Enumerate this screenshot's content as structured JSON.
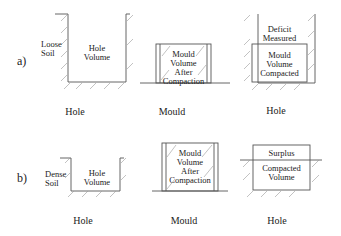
{
  "rows": [
    {
      "label": "a)",
      "soil_label_line1": "Loose",
      "soil_label_line2": "Soil",
      "hole_label_line1": "Hole",
      "hole_label_line2": "Volume",
      "mould_lines": [
        "Mould",
        "Volume",
        "After",
        "Compaction"
      ],
      "top_lines": [
        "Deficit",
        "Measured"
      ],
      "bottom_lines": [
        "Mould",
        "Volume",
        "Compacted"
      ],
      "captions": [
        "Hole",
        "Mould",
        "Hole"
      ]
    },
    {
      "label": "b)",
      "soil_label_line1": "Dense",
      "soil_label_line2": "Soil",
      "hole_label_line1": "Hole",
      "hole_label_line2": "Volume",
      "mould_lines": [
        "Mould",
        "Volume",
        "After",
        "Compaction"
      ],
      "top_lines": [
        "Surplus"
      ],
      "bottom_lines": [
        "Compacted",
        "Volume"
      ],
      "captions": [
        "Hole",
        "Mould",
        "Hole"
      ]
    }
  ],
  "colors": {
    "line": "#555555",
    "hatch": "#888888",
    "text": "#222222"
  }
}
